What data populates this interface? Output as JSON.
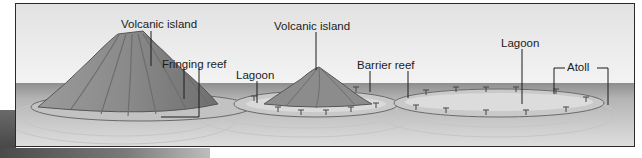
{
  "diagram": {
    "stages": [
      {
        "name": "fringing-reef-stage",
        "labels": {
          "island": "Volcanic island",
          "reef": "Fringing reef"
        }
      },
      {
        "name": "barrier-reef-stage",
        "labels": {
          "island": "Volcanic island",
          "lagoon": "Lagoon",
          "reef": "Barrier reef"
        }
      },
      {
        "name": "atoll-stage",
        "labels": {
          "lagoon": "Lagoon",
          "atoll": "Atoll"
        }
      }
    ],
    "colors": {
      "sky_top": "#e6e6e6",
      "sky_bottom": "#f2f2f2",
      "sea": "#9a9a9a",
      "water_near": "#d9d9d9",
      "volcano": "#8c8c8c",
      "reef": "#b5b5b5",
      "line": "#1c1c1c"
    }
  }
}
